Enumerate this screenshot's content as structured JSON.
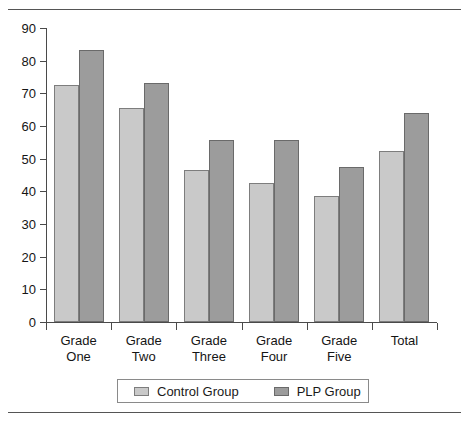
{
  "chart_data": {
    "type": "bar",
    "title": "",
    "xlabel": "",
    "ylabel": "",
    "ylim": [
      0,
      90
    ],
    "yticks": [
      0,
      10,
      20,
      30,
      40,
      50,
      60,
      70,
      80,
      90
    ],
    "grid": false,
    "legend_position": "bottom",
    "categories": [
      "Grade One",
      "Grade Two",
      "Grade Three",
      "Grade Four",
      "Grade Five",
      "Total"
    ],
    "category_lines": [
      [
        "Grade",
        "One"
      ],
      [
        "Grade",
        "Two"
      ],
      [
        "Grade",
        "Three"
      ],
      [
        "Grade",
        "Four"
      ],
      [
        "Grade",
        "Five"
      ],
      [
        "Total",
        ""
      ]
    ],
    "series": [
      {
        "name": "Control Group",
        "color": "#c9c9c9",
        "values": [
          72.4,
          65.4,
          46.4,
          42.7,
          38.7,
          52.2
        ]
      },
      {
        "name": "PLP Group",
        "color": "#9c9c9c",
        "values": [
          83.3,
          73.1,
          55.6,
          55.6,
          47.6,
          63.9
        ]
      }
    ]
  },
  "axis": {
    "tick_labels": [
      "90",
      "80",
      "70",
      "60",
      "50",
      "40",
      "30",
      "20",
      "10",
      "0"
    ]
  },
  "legend": {
    "items": [
      {
        "label": "Control Group",
        "color": "#c9c9c9"
      },
      {
        "label": "PLP Group",
        "color": "#9c9c9c"
      }
    ]
  }
}
